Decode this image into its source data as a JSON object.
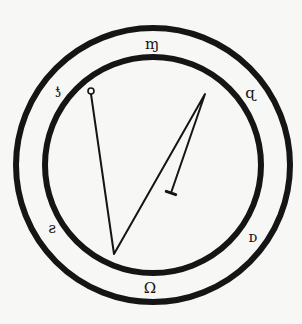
{
  "diagram": {
    "type": "sigil",
    "colors": {
      "background": "#f7f7f5",
      "ink": "#151515"
    },
    "rings": {
      "center": [
        153,
        165
      ],
      "outer_radius": 137,
      "inner_radius": 108,
      "stroke_width": 6
    },
    "glyphs": [
      {
        "id": "top",
        "char": "ɱ",
        "x": 152,
        "y": 44
      },
      {
        "id": "upper-left",
        "char": "ƾ",
        "x": 58,
        "y": 92
      },
      {
        "id": "upper-right",
        "char": "ɋ",
        "x": 250,
        "y": 93
      },
      {
        "id": "lower-left",
        "char": "ƨ",
        "x": 52,
        "y": 228
      },
      {
        "id": "lower-right",
        "char": "ᴅ",
        "x": 253,
        "y": 237
      },
      {
        "id": "bottom",
        "char": "Ω",
        "x": 150,
        "y": 288
      }
    ],
    "path": {
      "start_marker": "circle",
      "end_marker": "bar",
      "points": [
        [
          91,
          94
        ],
        [
          114,
          254
        ],
        [
          205,
          94
        ],
        [
          171,
          193
        ]
      ]
    }
  }
}
